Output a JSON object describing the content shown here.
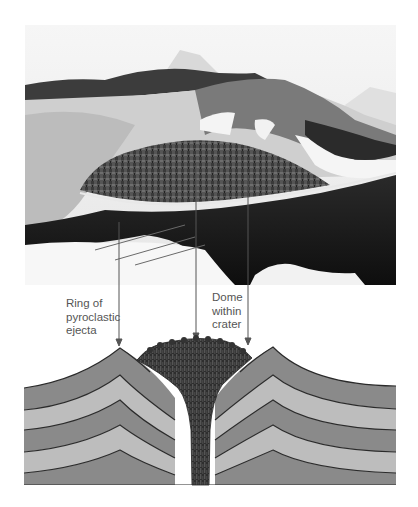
{
  "figure": {
    "photo": {
      "description": "Aerial black-and-white photograph of a volcanic crater with a lava dome inside, ringed by pyroclastic ejecta, snow patches on slopes, mountains in the background"
    },
    "labels": {
      "ring": {
        "lines": [
          "Ring of",
          "pyroclastic",
          "ejecta"
        ]
      },
      "dome": {
        "lines": [
          "Dome",
          "within",
          "crater"
        ]
      }
    },
    "cross_section": {
      "description": "Cross-section of a volcano showing alternating dark and light strata arched up around a central conduit filled with columnar lava that forms a dome in the crater",
      "layer_colors": {
        "dark": "#8a8a8a",
        "light": "#bdbdbd",
        "lava": "#3a3a3a",
        "line": "#2a2a2a"
      }
    },
    "arrows": [
      {
        "target": "ring-of-pyroclastic-ejecta",
        "x": 119
      },
      {
        "target": "dome-within-crater",
        "x": 196
      },
      {
        "target": "dome-within-crater",
        "x": 248
      }
    ]
  }
}
